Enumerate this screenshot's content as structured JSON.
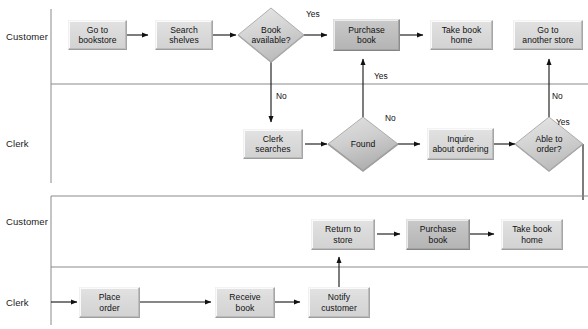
{
  "diagram": {
    "colors": {
      "box_fill": "#dadada",
      "box_accent_fill": "#bfbfbf",
      "diamond_fill": "#d4d4d4",
      "line": "#6e6e6e",
      "lane_divider": "#8a8a8a",
      "text": "#111111"
    }
  },
  "section_top": {
    "lanes": [
      {
        "label": "Customer"
      },
      {
        "label": "Clerk"
      }
    ],
    "nodes": [
      {
        "id": "go_to_bookstore",
        "label": "Go to\nbookstore",
        "shape": "process",
        "style": "normal"
      },
      {
        "id": "search_shelves",
        "label": "Search\nshelves",
        "shape": "process",
        "style": "normal"
      },
      {
        "id": "book_available",
        "label": "Book\navailable?",
        "shape": "decision",
        "style": "normal"
      },
      {
        "id": "purchase_book_1",
        "label": "Purchase\nbook",
        "shape": "process",
        "style": "accent"
      },
      {
        "id": "take_book_home_1",
        "label": "Take book\nhome",
        "shape": "process",
        "style": "normal"
      },
      {
        "id": "go_another_store",
        "label": "Go to\nanother store",
        "shape": "process",
        "style": "normal"
      },
      {
        "id": "clerk_searches",
        "label": "Clerk\nsearches",
        "shape": "process",
        "style": "normal"
      },
      {
        "id": "found",
        "label": "Found",
        "shape": "decision",
        "style": "normal"
      },
      {
        "id": "inquire_ordering",
        "label": "Inquire\nabout ordering",
        "shape": "process",
        "style": "normal"
      },
      {
        "id": "able_to_order",
        "label": "Able to\norder?",
        "shape": "decision",
        "style": "normal"
      }
    ],
    "edge_labels": [
      {
        "id": "book_available_yes",
        "text": "Yes"
      },
      {
        "id": "book_available_no",
        "text": "No"
      },
      {
        "id": "found_yes",
        "text": "Yes"
      },
      {
        "id": "found_no",
        "text": "No"
      },
      {
        "id": "able_to_order_no",
        "text": "No"
      },
      {
        "id": "able_to_order_yes",
        "text": "Yes"
      }
    ]
  },
  "section_bottom": {
    "lanes": [
      {
        "label": "Customer"
      },
      {
        "label": "Clerk"
      }
    ],
    "nodes": [
      {
        "id": "return_to_store",
        "label": "Return to\nstore",
        "shape": "process",
        "style": "normal"
      },
      {
        "id": "purchase_book_2",
        "label": "Purchase\nbook",
        "shape": "process",
        "style": "accent"
      },
      {
        "id": "take_book_home_2",
        "label": "Take book\nhome",
        "shape": "process",
        "style": "normal"
      },
      {
        "id": "place_order",
        "label": "Place\norder",
        "shape": "process",
        "style": "normal"
      },
      {
        "id": "receive_book",
        "label": "Receive\nbook",
        "shape": "process",
        "style": "normal"
      },
      {
        "id": "notify_customer",
        "label": "Notify\ncustomer",
        "shape": "process",
        "style": "normal"
      }
    ],
    "edge_labels": []
  }
}
